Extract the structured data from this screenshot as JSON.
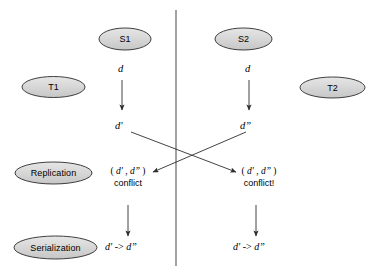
{
  "diagram": {
    "background_color": "#ffffff",
    "line_color": "#3a3a3a",
    "ellipse_fill": "#d6d6d6",
    "ellipse_stroke": "#2b2b2b",
    "text_color": "#000000",
    "divider": {
      "name": "vertical-divider",
      "x": 176,
      "y_top": 10,
      "y_bottom": 266
    },
    "sites": [
      {
        "id": "s1",
        "label": "S1",
        "side": "left"
      },
      {
        "id": "s2",
        "label": "S2",
        "side": "right"
      }
    ],
    "transactions": [
      {
        "id": "t1",
        "label": "T1",
        "side": "left"
      },
      {
        "id": "t2",
        "label": "T2",
        "side": "right"
      }
    ],
    "stages": [
      {
        "id": "replication",
        "label": "Replication"
      },
      {
        "id": "serialization",
        "label": "Serialization"
      }
    ],
    "columns": {
      "left": {
        "source_label": "d",
        "result_label": "d'",
        "conflict_pair_open": "( ",
        "conflict_pair_first": "d'",
        "conflict_pair_sep": " , ",
        "conflict_pair_second": "d”",
        "conflict_pair_close": " )",
        "conflict_word": "conflict",
        "serialization_first": "d'",
        "serialization_arrow": " -> ",
        "serialization_second": "d”"
      },
      "right": {
        "source_label": "d",
        "result_label": "d”",
        "conflict_pair_open": "( ",
        "conflict_pair_first": "d'",
        "conflict_pair_sep": " , ",
        "conflict_pair_second": "d”",
        "conflict_pair_close": " )",
        "conflict_word": "conflict!",
        "serialization_first": "d'",
        "serialization_arrow": " -> ",
        "serialization_second": "d”"
      }
    }
  }
}
